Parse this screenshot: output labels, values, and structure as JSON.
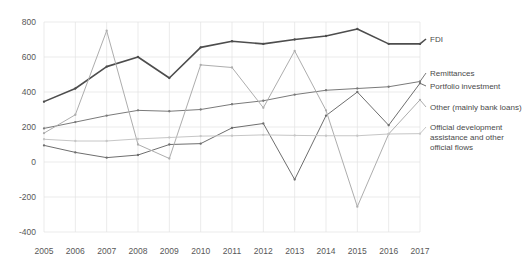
{
  "chart_data": {
    "type": "line",
    "title": "",
    "subtitle": "",
    "xlabel": "",
    "ylabel": "",
    "x": [
      2005,
      2006,
      2007,
      2008,
      2009,
      2010,
      2011,
      2012,
      2013,
      2014,
      2015,
      2016,
      2017
    ],
    "categories": [
      "2005",
      "2006",
      "2007",
      "2008",
      "2009",
      "2010",
      "2011",
      "2012",
      "2013",
      "2014",
      "2015",
      "2016",
      "2017"
    ],
    "xlim": [
      2005,
      2017
    ],
    "ylim": [
      -400,
      800
    ],
    "yticks": [
      -400,
      -200,
      0,
      200,
      400,
      600,
      800
    ],
    "ytick_labels": [
      "-400",
      "-200",
      "0",
      "200",
      "400",
      "600",
      "800"
    ],
    "grid": true,
    "grid_axis": "y",
    "legend_position": "right-inline",
    "series": [
      {
        "name": "FDI",
        "color": "#4d4d4d",
        "width": 1.6,
        "markers": true,
        "values": [
          345,
          420,
          545,
          600,
          480,
          655,
          690,
          675,
          700,
          720,
          760,
          675,
          675
        ]
      },
      {
        "name": "Remittances",
        "color": "#7a7a7a",
        "width": 1.0,
        "markers": true,
        "values": [
          192,
          228,
          265,
          295,
          290,
          300,
          330,
          350,
          385,
          410,
          420,
          430,
          460
        ]
      },
      {
        "name": "Portfolio investment",
        "color": "#6e6e6e",
        "width": 1.0,
        "markers": true,
        "values": [
          95,
          55,
          25,
          40,
          100,
          105,
          195,
          220,
          -100,
          265,
          400,
          210,
          450
        ]
      },
      {
        "name": "Other (mainly bank loans)",
        "color": "#adadad",
        "width": 1.0,
        "markers": true,
        "values": [
          165,
          270,
          750,
          100,
          20,
          555,
          540,
          310,
          635,
          295,
          -255,
          160,
          355
        ]
      },
      {
        "name": "Official development assistance and other official flows",
        "color": "#c6c6c6",
        "width": 1.0,
        "markers": true,
        "values": [
          130,
          120,
          120,
          132,
          140,
          148,
          150,
          155,
          152,
          150,
          150,
          160,
          162
        ]
      }
    ],
    "annotations": [
      {
        "label": "FDI",
        "x": 430,
        "y": 42
      },
      {
        "label": "Remittances",
        "x": 430,
        "y": 76
      },
      {
        "label": "Portfolio investment",
        "x": 430,
        "y": 89
      },
      {
        "label": "Other (mainly bank loans)",
        "x": 430,
        "y": 110
      },
      {
        "label": "Official development",
        "x": 430,
        "y": 130
      },
      {
        "label": "assistance and other",
        "x": 430,
        "y": 140
      },
      {
        "label": "official flows",
        "x": 430,
        "y": 150
      }
    ]
  },
  "axes": {
    "plot_left": 44,
    "plot_right": 420,
    "plot_top": 22,
    "plot_bottom": 232,
    "grid_color": "#e3e3e3",
    "background": "#ffffff"
  }
}
